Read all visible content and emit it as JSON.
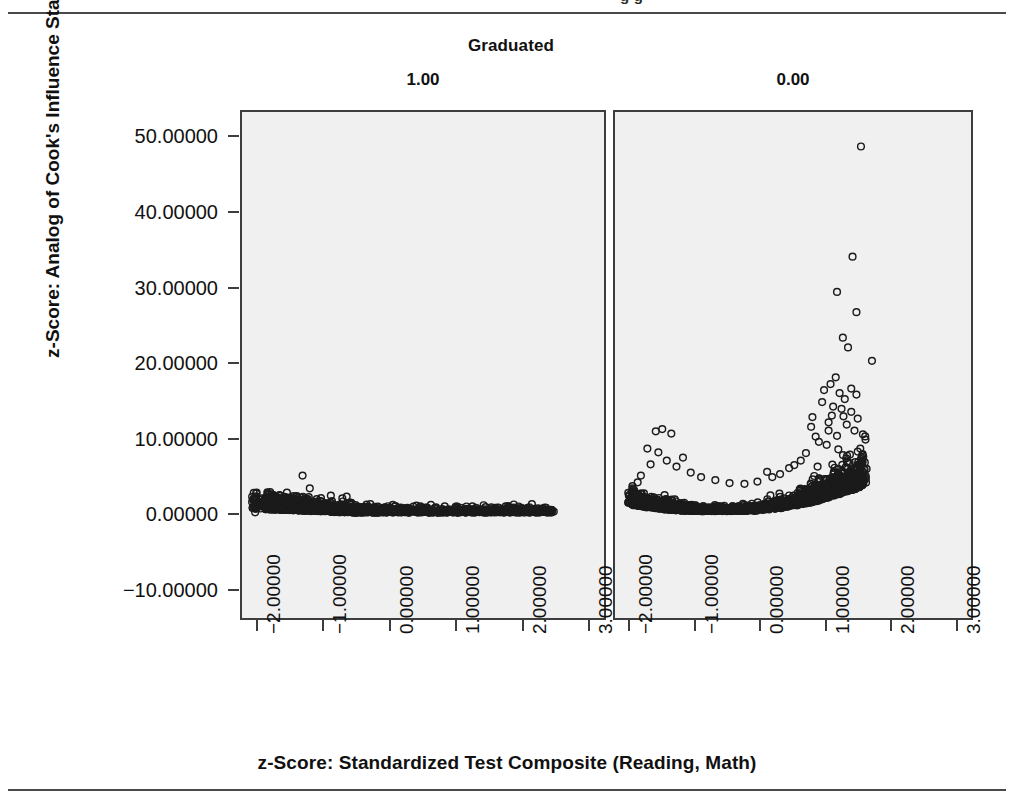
{
  "page": {
    "clipped_header_fragment": "g g",
    "rules": {
      "top": true,
      "bottom": true
    }
  },
  "chart_data": {
    "type": "scatter",
    "title": "",
    "group_label": "Graduated",
    "panels": [
      {
        "label": "1.00",
        "name": "graduated-1"
      },
      {
        "label": "0.00",
        "name": "graduated-0"
      }
    ],
    "xlabel": "z-Score: Standardized Test Composite (Reading, Math)",
    "ylabel": "z-Score: Analog of Cook's Influence Statistics",
    "xlim": [
      -2.25,
      3.25
    ],
    "ylim": [
      -14.0,
      53.5
    ],
    "xticks": [
      -2,
      -1,
      0,
      1,
      2,
      3
    ],
    "xticklabels": [
      "-2.00000",
      "-1.00000",
      "0.00000",
      "1.00000",
      "2.00000",
      "3.00000"
    ],
    "yticks": [
      50,
      40,
      30,
      20,
      10,
      0,
      -10
    ],
    "yticklabels": [
      "50.00000",
      "40.00000",
      "30.00000",
      "20.00000",
      "10.00000",
      "0.00000",
      "-10.00000"
    ],
    "grid": false,
    "legend": "none",
    "marker": "open-circle",
    "panel_background": "#f0f0f0",
    "marker_color": "#1b1b1b",
    "series": [
      {
        "name": "graduated-1",
        "panel": 0,
        "notable_points": [
          [
            -1.33,
            5.0
          ],
          [
            -1.22,
            3.3
          ],
          [
            -0.66,
            2.2
          ],
          [
            -2.05,
            0.1
          ],
          [
            0.07,
            0.9
          ],
          [
            0.83,
            0.9
          ],
          [
            1.0,
            0.85
          ],
          [
            2.08,
            0.5
          ]
        ],
        "description": "Dense near-zero band spanning x from -2.1 to 2.5, values mostly between -1 and 1, with a handful of small outliers up to ~5."
      },
      {
        "name": "graduated-0",
        "panel": 1,
        "notable_points": [
          [
            1.55,
            48.9
          ],
          [
            1.42,
            34.2
          ],
          [
            1.18,
            29.5
          ],
          [
            1.48,
            26.8
          ],
          [
            1.27,
            23.4
          ],
          [
            1.35,
            22.1
          ],
          [
            1.72,
            20.3
          ],
          [
            0.98,
            16.4
          ],
          [
            1.22,
            16.0
          ],
          [
            1.3,
            15.2
          ],
          [
            1.12,
            14.2
          ],
          [
            1.4,
            13.5
          ],
          [
            1.05,
            12.1
          ],
          [
            0.78,
            11.5
          ],
          [
            -1.52,
            11.2
          ],
          [
            -1.62,
            10.9
          ],
          [
            -1.38,
            10.6
          ],
          [
            1.18,
            10.3
          ],
          [
            0.9,
            9.5
          ],
          [
            -1.75,
            8.6
          ],
          [
            1.5,
            8.2
          ],
          [
            -1.2,
            7.4
          ],
          [
            0.1,
            5.5
          ],
          [
            -1.9,
            4.1
          ]
        ],
        "description": "U-shaped funnel: dense band near zero curving upward toward larger x, with a spray of outliers rising steeply beyond x ~0.7 and a second smaller cluster near x ~ -1.5."
      }
    ]
  }
}
